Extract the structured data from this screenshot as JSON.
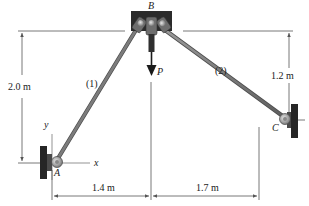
{
  "figure": {
    "points": {
      "A": {
        "label": "A"
      },
      "B": {
        "label": "B"
      },
      "C": {
        "label": "C"
      }
    },
    "members": [
      {
        "id": "1",
        "label": "(1)",
        "from": "A",
        "to": "B"
      },
      {
        "id": "2",
        "label": "(2)",
        "from": "B",
        "to": "C"
      }
    ],
    "load": {
      "label": "P",
      "direction": "down",
      "at": "B"
    },
    "axes": {
      "x_label": "x",
      "y_label": "y",
      "origin": "A"
    },
    "dimensions": {
      "height_AB": "2.0 m",
      "height_CB": "1.2 m",
      "horizontal_AB": "1.4 m",
      "horizontal_BC": "1.7 m"
    },
    "colors": {
      "member": "#7a7a7a",
      "support": "#2b2b2b",
      "dimension_line": "#555555",
      "text": "#1a1a1a"
    }
  }
}
